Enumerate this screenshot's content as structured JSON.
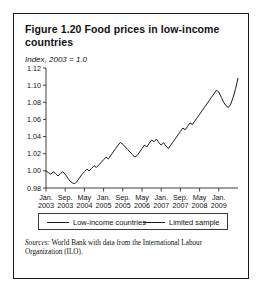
{
  "figure": {
    "title": "Figure 1.20  Food prices in low-income countries",
    "subtitle": "Index, 2003 = 1.0",
    "source_label": "Sources:",
    "source_text": " World Bank with data from the International Labour Organization (ILO)."
  },
  "legend": {
    "items": [
      {
        "label": "Low-income countries",
        "color": "#1a1a1a"
      },
      {
        "label": "Limited sample",
        "color": "#1a1a1a"
      }
    ]
  },
  "chart_data": {
    "type": "line",
    "title": "Figure 1.20  Food prices in low-income countries",
    "subtitle": "Index, 2003 = 1.0",
    "xlabel": "",
    "ylabel": "Index, 2003 = 1.0",
    "ylim": [
      0.98,
      1.12
    ],
    "ytick_values": [
      0.98,
      1.0,
      1.02,
      1.04,
      1.06,
      1.08,
      1.1,
      1.12
    ],
    "ytick_labels": [
      "0.98",
      "1.00",
      "1.02",
      "1.04",
      "1.06",
      "1.08",
      "1.10",
      "1.12"
    ],
    "grid": false,
    "legend_position": "below-plot",
    "xtick_labels": [
      {
        "month": "Jan.",
        "year": "2003"
      },
      {
        "month": "Sep.",
        "year": "2003"
      },
      {
        "month": "May",
        "year": "2004"
      },
      {
        "month": "Jan.",
        "year": "2005"
      },
      {
        "month": "Sep.",
        "year": "2005"
      },
      {
        "month": "May",
        "year": "2006"
      },
      {
        "month": "Jan.",
        "year": "2007"
      },
      {
        "month": "Sep.",
        "year": "2007"
      },
      {
        "month": "May",
        "year": "2008"
      },
      {
        "month": "Jan.",
        "year": "2009"
      }
    ],
    "xtick_positions_months": [
      0,
      8,
      16,
      24,
      32,
      40,
      48,
      56,
      64,
      72
    ],
    "x_range_months": [
      0,
      80
    ],
    "series": [
      {
        "name": "Low-income countries",
        "color": "#1a1a1a",
        "x_months": [
          0,
          1,
          2,
          3,
          4,
          5,
          6,
          7,
          8,
          9,
          10,
          11,
          12,
          13,
          14,
          15,
          16,
          17,
          18,
          19,
          20,
          21,
          22,
          23,
          24,
          25,
          26,
          27,
          28,
          29,
          30,
          31,
          32,
          33,
          34,
          35,
          36,
          37,
          38,
          39,
          40,
          41,
          42,
          43,
          44,
          45,
          46,
          47,
          48,
          49,
          50,
          51,
          52,
          53,
          54,
          55,
          56,
          57,
          58,
          59,
          60,
          61,
          62,
          63,
          64,
          65,
          66,
          67,
          68,
          69,
          70,
          71,
          72,
          73,
          74,
          75,
          76,
          77,
          78,
          79,
          80
        ],
        "values": [
          1.0,
          0.998,
          0.996,
          0.999,
          0.997,
          0.994,
          0.997,
          0.999,
          0.996,
          0.992,
          0.988,
          0.986,
          0.985,
          0.988,
          0.992,
          0.996,
          0.999,
          1.002,
          1.0,
          1.003,
          1.006,
          1.004,
          1.007,
          1.01,
          1.013,
          1.016,
          1.014,
          1.018,
          1.022,
          1.026,
          1.03,
          1.033,
          1.031,
          1.028,
          1.025,
          1.022,
          1.019,
          1.016,
          1.018,
          1.022,
          1.026,
          1.03,
          1.028,
          1.032,
          1.036,
          1.034,
          1.037,
          1.033,
          1.03,
          1.033,
          1.029,
          1.026,
          1.03,
          1.034,
          1.038,
          1.042,
          1.046,
          1.05,
          1.048,
          1.052,
          1.056,
          1.054,
          1.058,
          1.062,
          1.066,
          1.07,
          1.074,
          1.078,
          1.082,
          1.086,
          1.09,
          1.094,
          1.092,
          1.086,
          1.08,
          1.076,
          1.074,
          1.078,
          1.086,
          1.096,
          1.108
        ]
      }
    ]
  }
}
